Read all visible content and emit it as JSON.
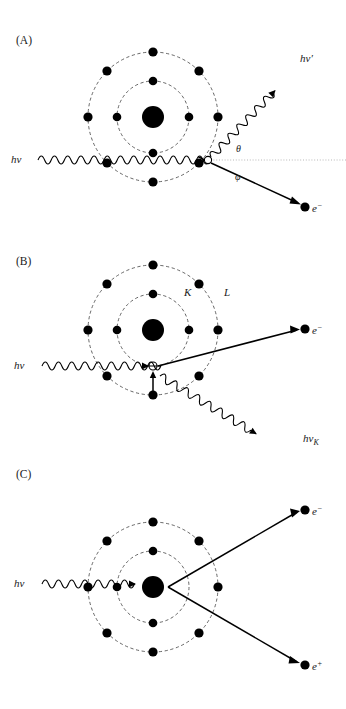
{
  "figure": {
    "type": "physics-diagram",
    "colors": {
      "ink": "#000000",
      "orbit": "#555555",
      "reference_line": "#999999",
      "background": "#ffffff"
    }
  },
  "panels": [
    {
      "id": "A",
      "label": "(A)",
      "process": "compton-scattering",
      "incident_photon_label": "hν",
      "scattered_photon_label": "hν′",
      "recoil_particle_label": "e−",
      "angle_photon_label": "θ",
      "angle_electron_label": "φ",
      "shells": 2,
      "inner_shell_electrons": 4,
      "outer_shell_electrons": 8,
      "has_reference_line": true
    },
    {
      "id": "B",
      "label": "(B)",
      "process": "photoelectric-effect",
      "incident_photon_label": "hν",
      "photoelectron_label": "e−",
      "characteristic_xray_label": "hν_K",
      "inner_shell_label": "K",
      "outer_shell_label": "L",
      "shells": 2,
      "inner_shell_electrons": 4,
      "outer_shell_electrons": 8,
      "has_vacancy": true,
      "has_transition_arrow": true
    },
    {
      "id": "C",
      "label": "(C)",
      "process": "pair-production",
      "incident_photon_label": "hν",
      "electron_label": "e−",
      "positron_label": "e+",
      "shells": 2,
      "inner_shell_electrons": 4,
      "outer_shell_electrons": 8
    }
  ],
  "glyphs": {
    "hnu": "hν",
    "hnu_prime": "hν",
    "prime": "′",
    "hnu_k_base": "hν",
    "hnu_k_sub": "K",
    "e": "e",
    "minus": "−",
    "plus": "+",
    "theta": "θ",
    "phi": "φ",
    "K": "K",
    "L": "L",
    "panel_a": "(A)",
    "panel_b": "(B)",
    "panel_c": "(C)"
  }
}
